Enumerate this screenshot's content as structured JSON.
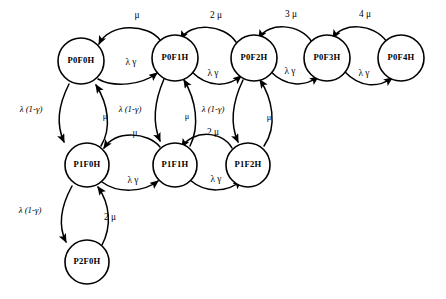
{
  "diagram": {
    "type": "state-transition-graph",
    "background_color": "#ffffff",
    "stroke_color": "#000000",
    "nodes": [
      {
        "id": "P0F0H",
        "label": "P0F0H",
        "cx": 81,
        "cy": 61,
        "r": 23
      },
      {
        "id": "P0F1H",
        "label": "P0F1H",
        "cx": 175,
        "cy": 58,
        "r": 23
      },
      {
        "id": "P0F2H",
        "label": "P0F2H",
        "cx": 254,
        "cy": 58,
        "r": 23
      },
      {
        "id": "P0F3H",
        "label": "P0F3H",
        "cx": 327,
        "cy": 58,
        "r": 23
      },
      {
        "id": "P0F4H",
        "label": "P0F4H",
        "cx": 401,
        "cy": 58,
        "r": 23
      },
      {
        "id": "P1F0H",
        "label": "P1F0H",
        "cx": 87,
        "cy": 165,
        "r": 22
      },
      {
        "id": "P1F1H",
        "label": "P1F1H",
        "cx": 175,
        "cy": 165,
        "r": 22
      },
      {
        "id": "P1F2H",
        "label": "P1F2H",
        "cx": 248,
        "cy": 165,
        "r": 22
      },
      {
        "id": "P2F0H",
        "label": "P2F0H",
        "cx": 87,
        "cy": 262,
        "r": 22
      }
    ],
    "edges": [
      {
        "from": "P0F1H",
        "to": "P0F0H",
        "label": "μ",
        "label_x": 137,
        "label_y": 16,
        "style": "upper-arc"
      },
      {
        "from": "P0F2H",
        "to": "P0F1H",
        "label": "2 μ",
        "label_x": 216,
        "label_y": 16,
        "style": "upper-arc"
      },
      {
        "from": "P0F3H",
        "to": "P0F2H",
        "label": "3 μ",
        "label_x": 291,
        "label_y": 15,
        "style": "upper-arc"
      },
      {
        "from": "P0F4H",
        "to": "P0F3H",
        "label": "4 μ",
        "label_x": 365,
        "label_y": 15,
        "style": "upper-arc"
      },
      {
        "from": "P0F0H",
        "to": "P0F1H",
        "label": "λ γ",
        "label_x": 131,
        "label_y": 63,
        "style": "lower-arc"
      },
      {
        "from": "P0F1H",
        "to": "P0F2H",
        "label": "λ γ",
        "label_x": 213,
        "label_y": 74,
        "style": "lower-arc"
      },
      {
        "from": "P0F2H",
        "to": "P0F3H",
        "label": "λ γ",
        "label_x": 290,
        "label_y": 72,
        "style": "lower-arc"
      },
      {
        "from": "P0F3H",
        "to": "P0F4H",
        "label": "λ γ",
        "label_x": 364,
        "label_y": 74,
        "style": "lower-arc"
      },
      {
        "from": "P0F0H",
        "to": "P1F0H",
        "label": "λ (1-γ)",
        "label_x": 31,
        "label_y": 110,
        "style": "vertical-down"
      },
      {
        "from": "P1F0H",
        "to": "P0F0H",
        "label": "μ",
        "label_x": 105,
        "label_y": 117,
        "style": "vertical-up"
      },
      {
        "from": "P0F1H",
        "to": "P1F1H",
        "label": "λ (1-γ)",
        "label_x": 130,
        "label_y": 110,
        "style": "vertical-down"
      },
      {
        "from": "P1F1H",
        "to": "P0F1H",
        "label": "μ",
        "label_x": 187,
        "label_y": 117,
        "style": "vertical-up"
      },
      {
        "from": "P0F2H",
        "to": "P1F2H",
        "label": "λ (1-γ)",
        "label_x": 213,
        "label_y": 110,
        "style": "vertical-down"
      },
      {
        "from": "P1F2H",
        "to": "P0F2H",
        "label": "μ",
        "label_x": 269,
        "label_y": 118,
        "style": "vertical-up"
      },
      {
        "from": "P1F1H",
        "to": "P1F0H",
        "label": "μ",
        "label_x": 135,
        "label_y": 134,
        "style": "upper-arc"
      },
      {
        "from": "P1F2H",
        "to": "P1F1H",
        "label": "2 μ",
        "label_x": 213,
        "label_y": 133,
        "style": "upper-arc"
      },
      {
        "from": "P1F0H",
        "to": "P1F1H",
        "label": "λ γ",
        "label_x": 133,
        "label_y": 181,
        "style": "lower-arc"
      },
      {
        "from": "P1F1H",
        "to": "P1F2H",
        "label": "λ γ",
        "label_x": 216,
        "label_y": 180,
        "style": "lower-arc"
      },
      {
        "from": "P1F0H",
        "to": "P2F0H",
        "label": "λ (1-γ)",
        "label_x": 30,
        "label_y": 211,
        "style": "vertical-down"
      },
      {
        "from": "P2F0H",
        "to": "P1F0H",
        "label": "2 μ",
        "label_x": 110,
        "label_y": 218,
        "style": "vertical-up"
      }
    ]
  }
}
